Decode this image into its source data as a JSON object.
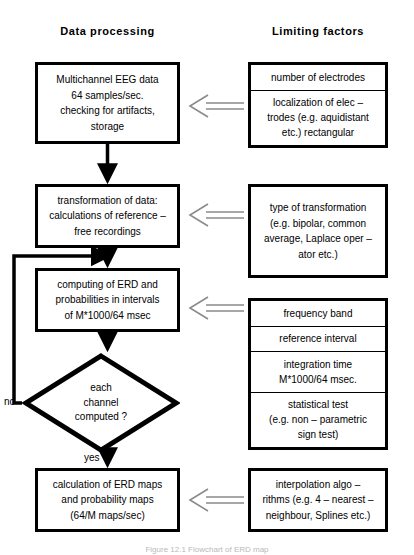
{
  "headings": {
    "left": "Data processing",
    "right": "Limiting factors"
  },
  "left_column": {
    "acquire": {
      "lines": [
        "Multichannel EEG data",
        "64 samples/sec.",
        "checking  for  artifacts,",
        "storage"
      ]
    },
    "transform": {
      "lines": [
        "transformation  of  data:",
        "calculations  of  reference –",
        "free recordings"
      ]
    },
    "compute": {
      "lines": [
        "computing of ERD and",
        "probabilities  in  intervals",
        "of  M*1000/64  msec"
      ]
    },
    "decision": {
      "lines": [
        "each",
        "channel",
        "computed ?"
      ],
      "no_label": "no",
      "yes_label": "yes"
    },
    "maps": {
      "lines": [
        "calculation of ERD maps",
        "and  probability  maps",
        "(64/M  maps/sec)"
      ]
    }
  },
  "right_column": {
    "electrodes": {
      "cells": [
        {
          "lines": [
            "number  of  electrodes"
          ]
        },
        {
          "lines": [
            "localization of elec –",
            "trodes (e.g. aquidistant",
            "etc.) rectangular"
          ]
        }
      ]
    },
    "transformation_types": {
      "lines": [
        "type of  transformation",
        "(e.g. bipolar,  common",
        "average, Laplace  oper –",
        "ator etc.)"
      ]
    },
    "parameters": {
      "cells": [
        {
          "lines": [
            "frequency  band"
          ]
        },
        {
          "lines": [
            "reference  interval"
          ]
        },
        {
          "lines": [
            "integration  time",
            "M*1000/64 msec."
          ]
        },
        {
          "lines": [
            "statistical  test",
            "(e.g. non – parametric",
            "sign test)"
          ]
        }
      ]
    },
    "interpolation": {
      "lines": [
        "interpolation  algo –",
        "rithms (e.g. 4 – nearest –",
        "neighbour,  Splines  etc.)"
      ]
    }
  },
  "caption": "Figure 12.1  Flowchart of ERD map",
  "colors": {
    "stroke": "#000000",
    "background": "#ffffff",
    "hollow_arrow": "#8a8a8a"
  }
}
